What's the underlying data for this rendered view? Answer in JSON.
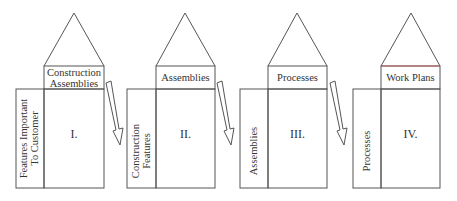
{
  "diagram": {
    "type": "QFD house-of-quality chain",
    "line_color": "#555555",
    "houses": [
      {
        "numeral": "I.",
        "top_label": "Construction\nAssemblies",
        "side_label": "Features Important\nTo Customer"
      },
      {
        "numeral": "II.",
        "top_label": "Assemblies",
        "side_label": "Construction\nFeatures"
      },
      {
        "numeral": "III.",
        "top_label": "Processes",
        "side_label": "Assemblies"
      },
      {
        "numeral": "IV.",
        "top_label": "Work Plans",
        "side_label": "Processes"
      }
    ],
    "connectors": [
      "arrow I→II",
      "arrow II→III",
      "arrow III→IV"
    ]
  }
}
